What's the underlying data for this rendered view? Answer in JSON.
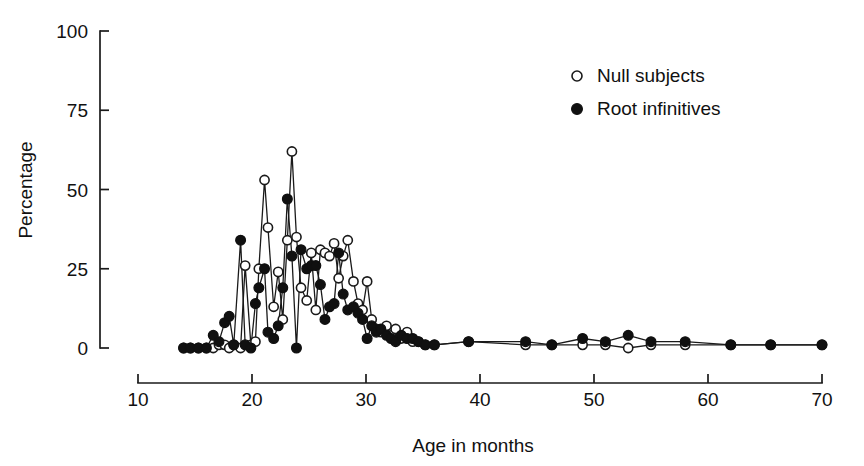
{
  "chart_data": {
    "type": "line",
    "title": "",
    "subtitle": "",
    "xlabel": "Age in months",
    "ylabel": "Percentage",
    "xlim": [
      10,
      70
    ],
    "ylim": [
      0,
      100
    ],
    "xticks": [
      10,
      20,
      30,
      40,
      50,
      60,
      70
    ],
    "xticklabels": [
      "10",
      "20",
      "30",
      "40",
      "50",
      "60",
      "70"
    ],
    "yticks": [
      0,
      25,
      50,
      75,
      100
    ],
    "yticklabels": [
      "0",
      "25",
      "50",
      "75",
      "100"
    ],
    "grid": false,
    "legend_position": "upper right",
    "series": [
      {
        "name": "Null subjects",
        "marker": "open-circle",
        "points": [
          [
            14.0,
            0
          ],
          [
            14.6,
            0
          ],
          [
            15.3,
            0
          ],
          [
            16.0,
            0
          ],
          [
            16.6,
            0
          ],
          [
            17.1,
            1
          ],
          [
            17.6,
            1
          ],
          [
            18.0,
            0
          ],
          [
            18.4,
            1
          ],
          [
            19.0,
            0
          ],
          [
            19.4,
            26
          ],
          [
            19.9,
            1
          ],
          [
            20.3,
            2
          ],
          [
            20.6,
            25
          ],
          [
            21.1,
            53
          ],
          [
            21.4,
            38
          ],
          [
            21.9,
            13
          ],
          [
            22.3,
            24
          ],
          [
            22.7,
            9
          ],
          [
            23.1,
            34
          ],
          [
            23.5,
            62
          ],
          [
            23.9,
            35
          ],
          [
            24.3,
            19
          ],
          [
            24.8,
            15
          ],
          [
            25.2,
            30
          ],
          [
            25.6,
            12
          ],
          [
            26.0,
            31
          ],
          [
            26.4,
            30
          ],
          [
            26.8,
            29
          ],
          [
            27.2,
            33
          ],
          [
            27.6,
            22
          ],
          [
            28.0,
            29
          ],
          [
            28.4,
            34
          ],
          [
            28.9,
            21
          ],
          [
            29.3,
            14
          ],
          [
            29.7,
            12
          ],
          [
            30.1,
            21
          ],
          [
            30.5,
            9
          ],
          [
            30.9,
            6
          ],
          [
            31.3,
            5
          ],
          [
            31.8,
            7
          ],
          [
            32.2,
            4
          ],
          [
            32.6,
            6
          ],
          [
            33.1,
            3
          ],
          [
            33.6,
            5
          ],
          [
            34.1,
            2
          ],
          [
            34.6,
            2
          ],
          [
            35.2,
            1
          ],
          [
            36.0,
            1
          ],
          [
            39.0,
            2
          ],
          [
            44.0,
            1
          ],
          [
            46.3,
            1
          ],
          [
            49.0,
            1
          ],
          [
            51.0,
            1
          ],
          [
            53.0,
            0
          ],
          [
            55.0,
            1
          ],
          [
            58.0,
            1
          ],
          [
            62.0,
            1
          ],
          [
            65.5,
            1
          ],
          [
            70.0,
            1
          ]
        ]
      },
      {
        "name": "Root infinitives",
        "marker": "filled-circle",
        "points": [
          [
            14.0,
            0
          ],
          [
            14.6,
            0
          ],
          [
            15.3,
            0
          ],
          [
            16.0,
            0
          ],
          [
            16.6,
            4
          ],
          [
            17.1,
            2
          ],
          [
            17.6,
            8
          ],
          [
            18.0,
            10
          ],
          [
            18.4,
            1
          ],
          [
            19.0,
            34
          ],
          [
            19.4,
            1
          ],
          [
            19.9,
            0
          ],
          [
            20.3,
            14
          ],
          [
            20.6,
            19
          ],
          [
            21.1,
            25
          ],
          [
            21.4,
            5
          ],
          [
            21.9,
            3
          ],
          [
            22.3,
            7
          ],
          [
            22.7,
            19
          ],
          [
            23.1,
            47
          ],
          [
            23.5,
            29
          ],
          [
            23.9,
            0
          ],
          [
            24.3,
            31
          ],
          [
            24.8,
            25
          ],
          [
            25.2,
            26
          ],
          [
            25.6,
            26
          ],
          [
            26.0,
            20
          ],
          [
            26.4,
            9
          ],
          [
            26.8,
            13
          ],
          [
            27.2,
            14
          ],
          [
            27.6,
            30
          ],
          [
            28.0,
            17
          ],
          [
            28.4,
            12
          ],
          [
            28.9,
            13
          ],
          [
            29.3,
            11
          ],
          [
            29.7,
            9
          ],
          [
            30.1,
            3
          ],
          [
            30.5,
            7
          ],
          [
            30.9,
            5
          ],
          [
            31.3,
            6
          ],
          [
            31.8,
            4
          ],
          [
            32.2,
            3
          ],
          [
            32.6,
            2
          ],
          [
            33.1,
            4
          ],
          [
            33.6,
            3
          ],
          [
            34.1,
            3
          ],
          [
            34.6,
            2
          ],
          [
            35.2,
            1
          ],
          [
            36.0,
            1
          ],
          [
            39.0,
            2
          ],
          [
            44.0,
            2
          ],
          [
            46.3,
            1
          ],
          [
            49.0,
            3
          ],
          [
            51.0,
            2
          ],
          [
            53.0,
            4
          ],
          [
            55.0,
            2
          ],
          [
            58.0,
            2
          ],
          [
            62.0,
            1
          ],
          [
            65.5,
            1
          ],
          [
            70.0,
            1
          ]
        ]
      }
    ]
  },
  "legend": {
    "items": [
      {
        "label": "Null subjects",
        "marker": "open-circle"
      },
      {
        "label": "Root infinitives",
        "marker": "filled-circle"
      }
    ]
  },
  "axes": {
    "x_title": "Age in months",
    "y_title": "Percentage"
  }
}
